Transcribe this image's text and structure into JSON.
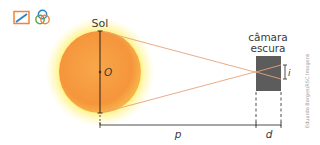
{
  "toolbar": {
    "icons": [
      {
        "name": "diagram-scale-icon"
      },
      {
        "name": "venn-circles-icon"
      }
    ]
  },
  "diagram": {
    "sun_label": "Sol",
    "center_label": "O",
    "camera_label_line1": "câmara",
    "camera_label_line2": "escura",
    "image_label": "i",
    "distance_p_label": "p",
    "distance_d_label": "d",
    "credit": "Eduardo Borges/ASC Imagens"
  },
  "colors": {
    "sun_core": "#f59a3e",
    "sun_edge": "#f7b84e",
    "sun_glow": "#fff27a",
    "ray": "#e8a37a",
    "camera_box": "#5a5a5a",
    "line": "#3b3b3b"
  }
}
